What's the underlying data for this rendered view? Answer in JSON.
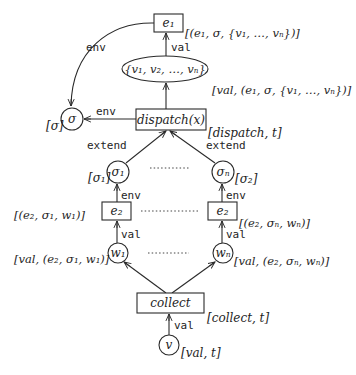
{
  "diagram": {
    "colors": {
      "line": "#2a2a2a",
      "text": "#1e1e1e",
      "background": "#ffffff"
    },
    "nodes": {
      "e1": {
        "text": "e₁",
        "annotation": "[(e₁, σ, {v₁, …, vₙ})]"
      },
      "set": {
        "text": "{v₁, v₂, …, vₙ}",
        "annotation": "[val, (e₁, σ, {v₁, …, vₙ})]"
      },
      "sigma": {
        "text": "σ",
        "annotation": "[σ]"
      },
      "dispatch": {
        "text": "dispatch(x)",
        "annotation": "[dispatch, t]"
      },
      "sigma1": {
        "text": "σ₁",
        "annotation": "[σ₁]"
      },
      "sigman": {
        "text": "σₙ",
        "annotation": "[σ₂]"
      },
      "e2_left": {
        "text": "e₂",
        "annotation": "[(e₂, σ₁, w₁)]"
      },
      "e2_right": {
        "text": "e₂",
        "annotation": "[(e₂, σₙ, wₙ)]"
      },
      "w1": {
        "text": "w₁",
        "annotation": "[val, (e₂, σ₁, w₁)]"
      },
      "wn": {
        "text": "wₙ",
        "annotation": "[val, (e₂, σₙ, wₙ)]"
      },
      "collect": {
        "text": "collect",
        "annotation": "[collect, t]"
      },
      "v": {
        "text": "v",
        "annotation": "[val, t]"
      }
    },
    "edges": {
      "e1_to_sigma": "env",
      "set_to_e1": "val",
      "dispatch_to_sigma": "env",
      "sigma1_to_dispatch": "extend",
      "sigman_to_dispatch": "extend",
      "e2left_to_sigma1": "env",
      "e2right_to_sigman": "env",
      "w1_to_e2left": "val",
      "wn_to_e2right": "val",
      "v_to_collect": "val"
    }
  }
}
